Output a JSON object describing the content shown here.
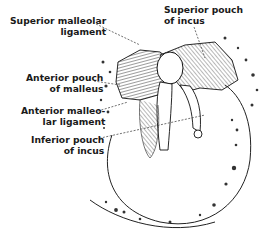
{
  "diagram": {
    "type": "anatomical-illustration",
    "labels": [
      {
        "id": "superior-malleolar-ligament",
        "lines": [
          "Superior malleolar",
          "ligament"
        ]
      },
      {
        "id": "superior-pouch-of-incus",
        "lines": [
          "Superior pouch",
          "of incus"
        ]
      },
      {
        "id": "anterior-pouch-of-malleus",
        "lines": [
          "Anterior pouch",
          "of malleus"
        ]
      },
      {
        "id": "anterior-malleolar-ligament",
        "lines": [
          "Anterior malleo-",
          "lar ligament"
        ]
      },
      {
        "id": "inferior-pouch-of-incus",
        "lines": [
          "Inferior pouch",
          "of incus"
        ]
      }
    ],
    "colors": {
      "ink": "#1a1a1a",
      "background": "#ffffff"
    }
  }
}
